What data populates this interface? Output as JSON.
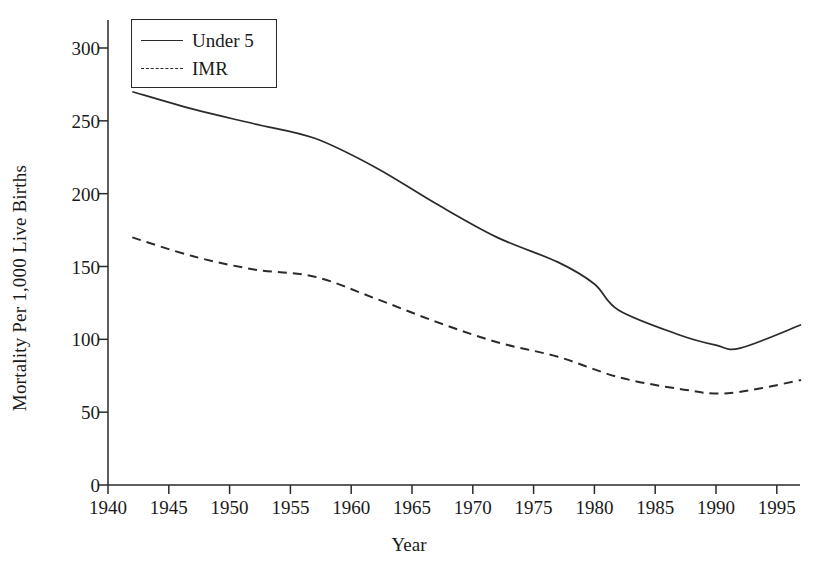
{
  "chart_data": {
    "type": "line",
    "title": "",
    "xlabel": "Year",
    "ylabel": "Mortality Per 1,000 Live Births",
    "xlim": [
      1939,
      1998
    ],
    "ylim": [
      0,
      315
    ],
    "grid": false,
    "legend_position": "top-left",
    "xticks": [
      1940,
      1945,
      1950,
      1955,
      1960,
      1965,
      1970,
      1975,
      1980,
      1985,
      1990,
      1995
    ],
    "xtick_labels": [
      "1940",
      "1945",
      "1950",
      "1955",
      "1960",
      "1965",
      "1970",
      "1975",
      "1980",
      "1985",
      "1990",
      "1995"
    ],
    "yticks": [
      0,
      50,
      100,
      150,
      200,
      250,
      300
    ],
    "ytick_labels": [
      "0",
      "50",
      "100",
      "150",
      "200",
      "250",
      "300"
    ],
    "series": [
      {
        "name": "Under 5",
        "style": "solid",
        "color": "#2a2a2a",
        "x": [
          1942,
          1947,
          1952,
          1957,
          1962,
          1967,
          1972,
          1977,
          1980,
          1982,
          1987,
          1990,
          1992,
          1997
        ],
        "values": [
          270,
          258,
          248,
          238,
          218,
          193,
          170,
          153,
          138,
          120,
          103,
          96,
          94,
          110
        ]
      },
      {
        "name": "IMR",
        "style": "dashed",
        "color": "#2a2a2a",
        "x": [
          1942,
          1947,
          1952,
          1957,
          1962,
          1967,
          1972,
          1977,
          1982,
          1987,
          1991,
          1997
        ],
        "values": [
          170,
          157,
          148,
          143,
          128,
          112,
          98,
          88,
          74,
          66,
          63,
          72
        ]
      }
    ]
  },
  "legend": {
    "entries": [
      {
        "label": "Under 5",
        "style": "solid"
      },
      {
        "label": "IMR",
        "style": "dashed"
      }
    ]
  },
  "axes": {
    "x_title": "Year",
    "y_title": "Mortality Per 1,000 Live Births"
  }
}
